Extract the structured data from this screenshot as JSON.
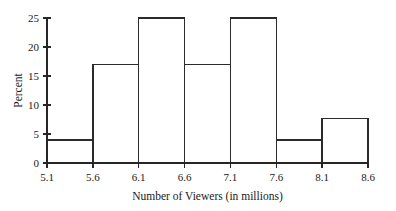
{
  "chart_data": {
    "type": "bar",
    "title": "",
    "xlabel": "Number of Viewers (in millions)",
    "ylabel": "Percent",
    "bin_edges": [
      5.1,
      5.6,
      6.1,
      6.6,
      7.1,
      7.6,
      8.1,
      8.6
    ],
    "categories": [
      "5.1-5.6",
      "5.6-6.1",
      "6.1-6.6",
      "6.6-7.1",
      "7.1-7.6",
      "7.6-8.1",
      "8.1-8.6"
    ],
    "values": [
      4,
      17,
      25,
      17,
      25,
      4,
      7.7
    ],
    "xtick_labels": [
      "5.1",
      "5.6",
      "6.1",
      "6.6",
      "7.1",
      "7.6",
      "8.1",
      "8.6"
    ],
    "ytick_labels": [
      "0",
      "5",
      "10",
      "15",
      "20",
      "25"
    ],
    "ytick_values": [
      0,
      5,
      10,
      15,
      20,
      25
    ],
    "xlim": [
      5.1,
      8.6
    ],
    "ylim": [
      0,
      25
    ],
    "grid": false,
    "legend": false,
    "bar_fill": "#ffffff",
    "bar_stroke": "#2b2b2b",
    "axis_color": "#262626",
    "background": "#ffffff"
  }
}
